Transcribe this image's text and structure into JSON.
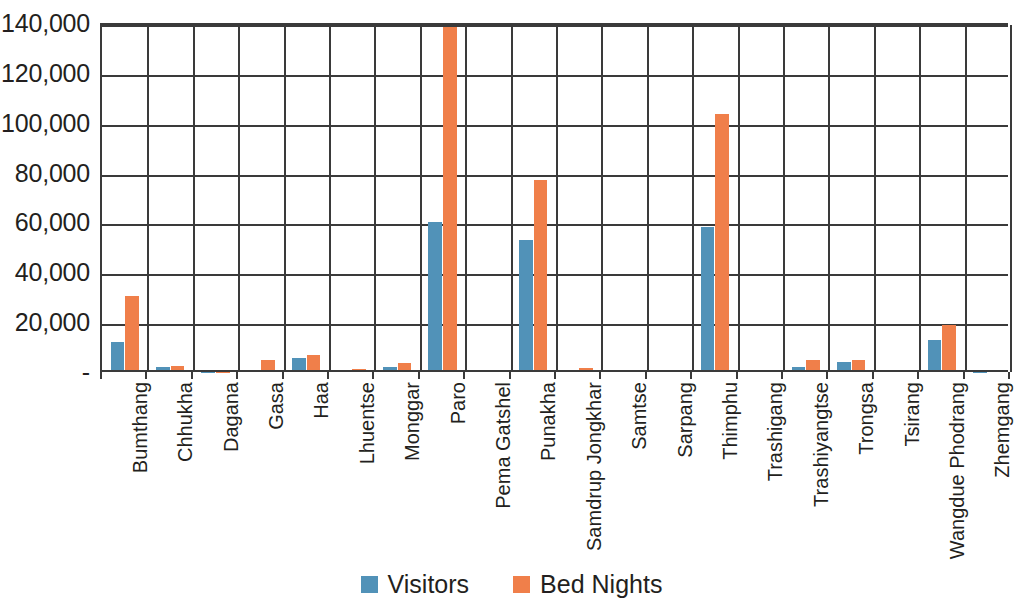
{
  "chart_data": {
    "type": "bar",
    "title": "",
    "subtitle": "",
    "xlabel": "",
    "ylabel": "",
    "ylim": [
      0,
      140000
    ],
    "grid": true,
    "legend_position": "bottom",
    "y_ticks": [
      "-",
      "20,000",
      "40,000",
      "60,000",
      "80,000",
      "100,000",
      "120,000",
      "140,000"
    ],
    "y_tick_values": [
      0,
      20000,
      40000,
      60000,
      80000,
      100000,
      120000,
      140000
    ],
    "categories": [
      "Bumthang",
      "Chhukha",
      "Dagana",
      "Gasa",
      "Haa",
      "Lhuentse",
      "Monggar",
      "Paro",
      "Pema Gatshel",
      "Punakha",
      "Samdrup Jongkhar",
      "Samtse",
      "Sarpang",
      "Thimphu",
      "Trashigang",
      "Trashiyangtse",
      "Trongsa",
      "Tsirang",
      "Wangdue Phodrang",
      "Zhemgang"
    ],
    "series": [
      {
        "name": "Visitors",
        "color": "#5192b8",
        "values": [
          12000,
          2000,
          100,
          700,
          5500,
          500,
          2200,
          60000,
          0,
          53000,
          600,
          0,
          0,
          58000,
          400,
          2000,
          4000,
          0,
          12800,
          200
        ]
      },
      {
        "name": "Bed Nights",
        "color": "#f07f4a",
        "values": [
          30500,
          2500,
          200,
          4800,
          7000,
          1200,
          3800,
          138500,
          0,
          77000,
          1600,
          0,
          0,
          103500,
          1000,
          4800,
          4800,
          0,
          19000,
          600
        ]
      }
    ]
  },
  "legend": {
    "items": [
      {
        "label": "Visitors",
        "swatch": "visitors"
      },
      {
        "label": "Bed Nights",
        "swatch": "bednights"
      }
    ]
  }
}
